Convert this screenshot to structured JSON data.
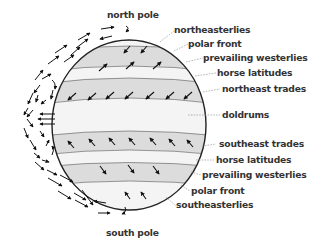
{
  "diagram": {
    "poles": {
      "north": "north pole",
      "south": "south pole"
    },
    "labels": [
      {
        "text": "northeasterlies",
        "x": 174,
        "y": 29
      },
      {
        "text": "polar front",
        "x": 188,
        "y": 42
      },
      {
        "text": "prevailing westerlies",
        "x": 204,
        "y": 56
      },
      {
        "text": "horse latitudes",
        "x": 218,
        "y": 71
      },
      {
        "text": "northeast trades",
        "x": 222,
        "y": 87
      },
      {
        "text": "doldrums",
        "x": 222,
        "y": 113
      },
      {
        "text": "southeast trades",
        "x": 218,
        "y": 142
      },
      {
        "text": "horse latitudes",
        "x": 216,
        "y": 158
      },
      {
        "text": "prevailing westerlies",
        "x": 202,
        "y": 173
      },
      {
        "text": "polar front",
        "x": 191,
        "y": 189
      },
      {
        "text": "southeasterlies",
        "x": 176,
        "y": 203
      }
    ],
    "colors": {
      "band_light": "#f4f4f4",
      "band_dark": "#dcdcdc",
      "outline": "#222222",
      "leader": "#999999",
      "text": "#333333"
    }
  }
}
